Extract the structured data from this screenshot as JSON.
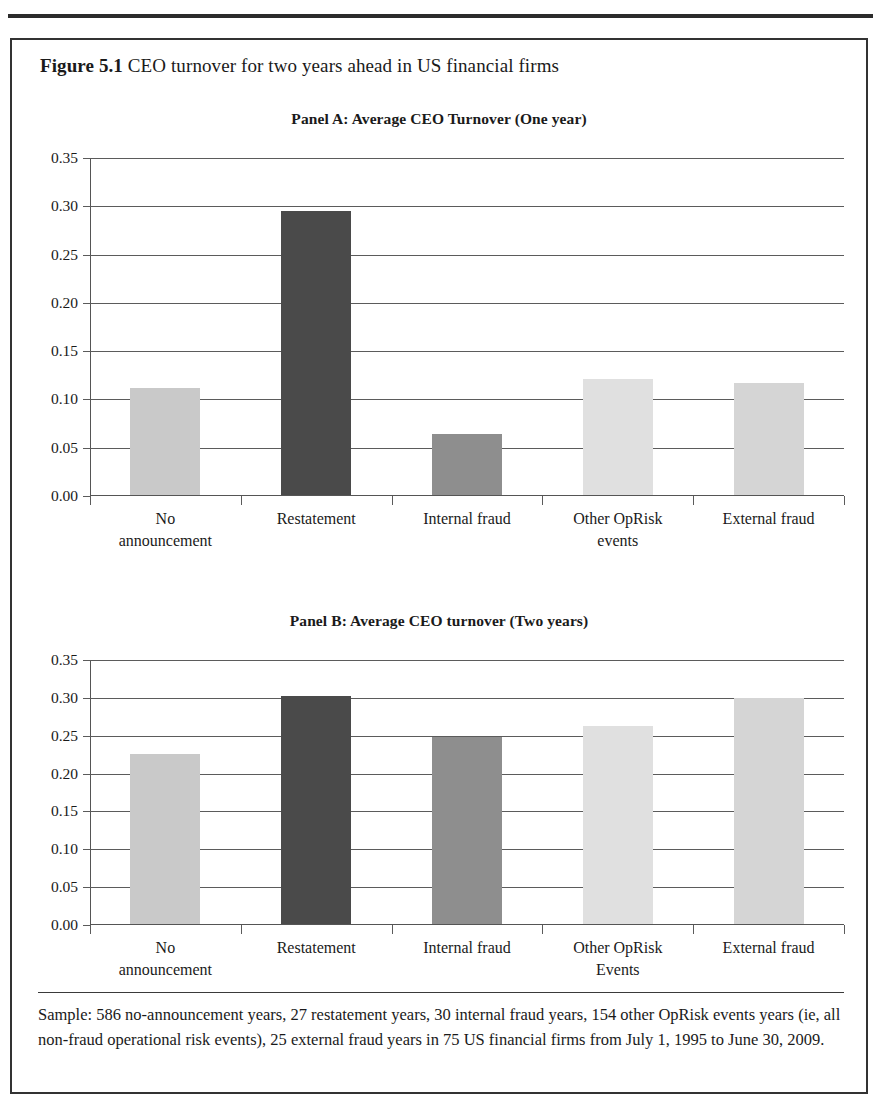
{
  "figure": {
    "label": "Figure 5.1",
    "title": "CEO turnover for two years ahead in US financial firms",
    "caption": "Sample: 586 no-announcement years, 27 restatement years, 30 internal fraud years, 154 other OpRisk events years (ie, all non-fraud operational risk events), 25 external fraud years in 75 US financial firms from July 1, 1995 to June 30, 2009."
  },
  "colors": {
    "light_gray": "#c9c9c9",
    "medium_gray": "#8e8e8e",
    "dark_gray": "#4a4a4a",
    "axis": "#5b5b5b",
    "text": "#1a1a1a",
    "border": "#333333"
  },
  "chart_data": [
    {
      "type": "bar",
      "title": "Panel A: Average CEO Turnover (One year)",
      "panel": "A",
      "xlabel": "",
      "ylabel": "",
      "ylim": [
        0,
        0.35
      ],
      "grid": true,
      "legend": "none",
      "ytick_labels": [
        "0.35",
        "0.30",
        "0.25",
        "0.20",
        "0.15",
        "0.10",
        "0.05",
        "0.00"
      ],
      "ytick_values": [
        0.35,
        0.3,
        0.25,
        0.2,
        0.15,
        0.1,
        0.05,
        0.0
      ],
      "categories": [
        "No\nannouncement",
        "Restatement",
        "Internal fraud",
        "Other OpRisk\nevents",
        "External fraud"
      ],
      "category_lines": [
        [
          "No",
          "announcement"
        ],
        [
          "Restatement",
          ""
        ],
        [
          "Internal fraud",
          ""
        ],
        [
          "Other OpRisk",
          "events"
        ],
        [
          "External fraud",
          ""
        ]
      ],
      "values": [
        0.111,
        0.295,
        0.063,
        0.12,
        0.116
      ],
      "bar_colors": [
        "#c9c9c9",
        "#4a4a4a",
        "#8e8e8e",
        "#e0e0e0",
        "#d5d5d5"
      ]
    },
    {
      "type": "bar",
      "title": "Panel B: Average CEO turnover (Two years)",
      "panel": "B",
      "xlabel": "",
      "ylabel": "",
      "ylim": [
        0,
        0.35
      ],
      "grid": true,
      "legend": "none",
      "ytick_labels": [
        "0.35",
        "0.30",
        "0.25",
        "0.20",
        "0.15",
        "0.10",
        "0.05",
        "0.00"
      ],
      "ytick_values": [
        0.35,
        0.3,
        0.25,
        0.2,
        0.15,
        0.1,
        0.05,
        0.0
      ],
      "categories": [
        "No\nannouncement",
        "Restatement",
        "Internal fraud",
        "Other OpRisk\nEvents",
        "External fraud"
      ],
      "category_lines": [
        [
          "No",
          "announcement"
        ],
        [
          "Restatement",
          ""
        ],
        [
          "Internal fraud",
          ""
        ],
        [
          "Other OpRisk",
          "Events"
        ],
        [
          "External fraud",
          ""
        ]
      ],
      "values": [
        0.225,
        0.302,
        0.248,
        0.263,
        0.299
      ],
      "bar_colors": [
        "#c9c9c9",
        "#4a4a4a",
        "#8e8e8e",
        "#e0e0e0",
        "#d5d5d5"
      ]
    }
  ]
}
